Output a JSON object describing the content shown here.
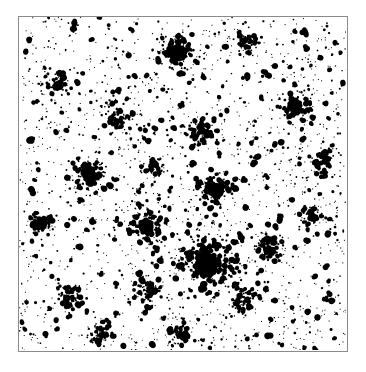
{
  "figure": {
    "type": "binary-point-pattern-map",
    "title": "",
    "background_color": "#ffffff",
    "point_color": "#000000",
    "frame_color": "#8a8a8a",
    "frame_line_width_px": 1.5,
    "frame": {
      "x": 18,
      "y": 16,
      "width": 330,
      "height": 336
    },
    "image_size": {
      "width": 366,
      "height": 372
    }
  },
  "chart_data": {
    "type": "scatter",
    "title": "",
    "subtitle": "",
    "xlabel": "",
    "ylabel": "",
    "xlim": [
      0,
      1
    ],
    "ylim": [
      0,
      1
    ],
    "grid": false,
    "legend": null,
    "tick_labels_x": [],
    "tick_labels_y": [],
    "annotations": [],
    "marker": {
      "shape": "irregular-blob",
      "color": "#000000",
      "min_radius_px": 0.8,
      "max_radius_px": 3.2
    },
    "total_points": 2600,
    "background_density": 0.0055,
    "clusters": [
      {
        "id": "c1",
        "cx": 0.575,
        "cy": 0.745,
        "radius": 0.072,
        "count": 330,
        "core_radius": 0.03,
        "label": "primary-cluster"
      },
      {
        "id": "c2",
        "cx": 0.39,
        "cy": 0.63,
        "radius": 0.04,
        "count": 105,
        "core_radius": 0.016,
        "label": "left-mid-cluster"
      },
      {
        "id": "c3",
        "cx": 0.6,
        "cy": 0.52,
        "radius": 0.042,
        "count": 115,
        "core_radius": 0.017,
        "label": "center-cluster"
      },
      {
        "id": "c4",
        "cx": 0.215,
        "cy": 0.47,
        "radius": 0.042,
        "count": 110,
        "core_radius": 0.017,
        "label": "west-cluster"
      },
      {
        "id": "c5",
        "cx": 0.485,
        "cy": 0.11,
        "radius": 0.046,
        "count": 120,
        "core_radius": 0.018,
        "label": "north-cluster"
      },
      {
        "id": "c6",
        "cx": 0.845,
        "cy": 0.265,
        "radius": 0.038,
        "count": 92,
        "core_radius": 0.015,
        "label": "northeast-cluster"
      },
      {
        "id": "c7",
        "cx": 0.76,
        "cy": 0.69,
        "radius": 0.032,
        "count": 76,
        "core_radius": 0.013,
        "label": "east-cluster"
      },
      {
        "id": "c8",
        "cx": 0.395,
        "cy": 0.815,
        "radius": 0.03,
        "count": 62,
        "core_radius": 0.012,
        "label": "southwest-cluster"
      },
      {
        "id": "c9",
        "cx": 0.16,
        "cy": 0.84,
        "radius": 0.028,
        "count": 55,
        "core_radius": 0.011,
        "label": "south-west-cluster"
      },
      {
        "id": "c10",
        "cx": 0.68,
        "cy": 0.845,
        "radius": 0.03,
        "count": 58,
        "core_radius": 0.012,
        "label": "south-east-cluster"
      },
      {
        "id": "c11",
        "cx": 0.305,
        "cy": 0.305,
        "radius": 0.034,
        "count": 70,
        "core_radius": 0.013,
        "label": "upper-left-cluster"
      },
      {
        "id": "c12",
        "cx": 0.93,
        "cy": 0.43,
        "radius": 0.026,
        "count": 48,
        "core_radius": 0.01,
        "label": "far-east-cluster"
      },
      {
        "id": "c13",
        "cx": 0.07,
        "cy": 0.62,
        "radius": 0.026,
        "count": 46,
        "core_radius": 0.01,
        "label": "far-west-cluster"
      },
      {
        "id": "c14",
        "cx": 0.555,
        "cy": 0.345,
        "radius": 0.028,
        "count": 52,
        "core_radius": 0.011,
        "label": "upper-center-cluster"
      },
      {
        "id": "c15",
        "cx": 0.885,
        "cy": 0.595,
        "radius": 0.024,
        "count": 40,
        "core_radius": 0.01,
        "label": "mid-east-cluster"
      },
      {
        "id": "c16",
        "cx": 0.245,
        "cy": 0.955,
        "radius": 0.026,
        "count": 44,
        "core_radius": 0.01,
        "label": "bottom-left-cluster"
      },
      {
        "id": "c17",
        "cx": 0.49,
        "cy": 0.95,
        "radius": 0.024,
        "count": 40,
        "core_radius": 0.01,
        "label": "bottom-center-cluster"
      },
      {
        "id": "c18",
        "cx": 0.12,
        "cy": 0.195,
        "radius": 0.026,
        "count": 44,
        "core_radius": 0.01,
        "label": "top-left-cluster"
      },
      {
        "id": "c19",
        "cx": 0.7,
        "cy": 0.075,
        "radius": 0.028,
        "count": 48,
        "core_radius": 0.011,
        "label": "top-right-cluster"
      },
      {
        "id": "c20",
        "cx": 0.415,
        "cy": 0.455,
        "radius": 0.024,
        "count": 38,
        "core_radius": 0.01,
        "label": "interior-cluster"
      }
    ],
    "random_seed": 20240517
  }
}
